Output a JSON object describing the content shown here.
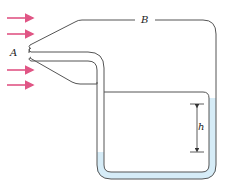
{
  "diagram": {
    "labels": {
      "inlet": "A",
      "static_chamber": "B",
      "height_difference": "h"
    },
    "arrows": {
      "count": 4,
      "color": "#e05585",
      "direction": "right"
    },
    "colors": {
      "tube_outline": "#555555",
      "fluid": "#d6ecf7",
      "arrow": "#e05585"
    }
  }
}
